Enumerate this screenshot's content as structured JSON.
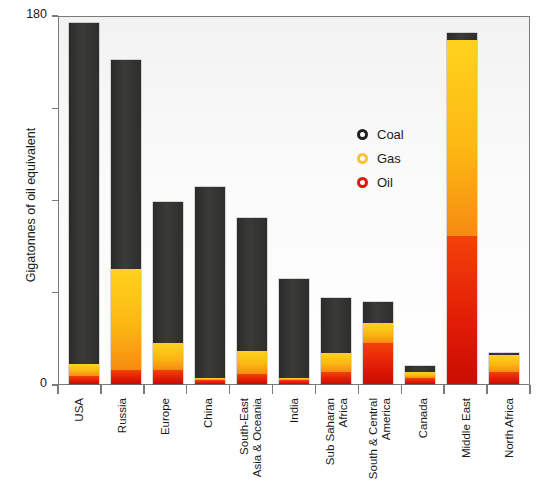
{
  "chart_data": {
    "type": "bar",
    "stacked": true,
    "title": "",
    "xlabel": "",
    "ylabel": "Gigatonnes of oil equivalent",
    "ylim": [
      0,
      180
    ],
    "yticks": [
      0,
      45,
      90,
      135,
      180
    ],
    "ytick_labels": [
      "0",
      "",
      "",
      "",
      "180"
    ],
    "grid": false,
    "legend_position": "inside-right-upper",
    "categories": [
      "USA",
      "Russia",
      "Europe",
      "China",
      "South-East\nAsia & Oceania",
      "India",
      "Sub Saharan\nAfrica",
      "South & Central\nAmerica",
      "Canada",
      "Middle East",
      "North Africa"
    ],
    "series": [
      {
        "name": "Oil",
        "color": "#e01b06",
        "values": [
          4,
          7,
          7,
          2,
          5,
          2,
          6,
          20,
          3,
          72,
          6
        ]
      },
      {
        "name": "Gas",
        "color": "#fcb813",
        "values": [
          6,
          49,
          13,
          1,
          11,
          1,
          9,
          10,
          3,
          96,
          8
        ]
      },
      {
        "name": "Coal",
        "color": "#2e2e2c",
        "values": [
          166,
          102,
          69,
          93,
          65,
          48,
          27,
          10,
          3,
          3,
          1
        ]
      }
    ],
    "stack_order_bottom_to_top": [
      "Oil",
      "Gas",
      "Coal"
    ],
    "totals": [
      176,
      158,
      89,
      96,
      81,
      51,
      42,
      40,
      9,
      171,
      15
    ]
  },
  "legend": {
    "items": [
      {
        "label": "Coal",
        "marker": "ring-icon",
        "color": "#231f20"
      },
      {
        "label": "Gas",
        "marker": "ring-icon",
        "color": "#f9c233"
      },
      {
        "label": "Oil",
        "marker": "ring-icon",
        "color": "#e2170b"
      }
    ]
  },
  "axes": {
    "y_title": "Gigatonnes of oil equivalent",
    "y_max_label": "180",
    "y_min_label": "0"
  }
}
